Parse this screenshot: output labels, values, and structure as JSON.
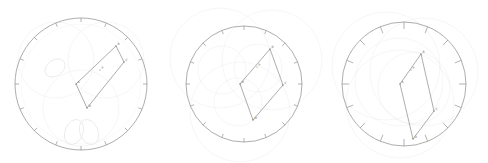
{
  "figure": {
    "title": "",
    "background_color": "#ffffff",
    "width": 488,
    "height": 163,
    "panel_count": 3
  },
  "colors": {
    "main_circle": "#8a8a8a",
    "polygon": "#8a8a8a",
    "construction_faint": "#e2e2ea",
    "construction_faint_2": "#e8e8ee",
    "tick": "#8a8a8a",
    "label": "#6a6a6a",
    "vertex_dot": "#7a7a7a",
    "background": "#ffffff"
  },
  "chart_data": {
    "type": "scatter",
    "title": "",
    "xlabel": "",
    "ylabel": "",
    "grid": false,
    "legend": "none",
    "panels": [
      {
        "name": "panel-1",
        "index": 1,
        "center": [
          81,
          84
        ],
        "main_circle_radius": 66,
        "tick_count": 16,
        "tick_length": 4,
        "tick_inward": true,
        "polygon_label": "parallelogram",
        "polygon_vertices": [
          {
            "label": "A",
            "x": 76,
            "y": 84
          },
          {
            "label": "B",
            "x": 116,
            "y": 46
          },
          {
            "label": "C",
            "x": 124,
            "y": 62
          },
          {
            "label": "D",
            "x": 87,
            "y": 108
          }
        ],
        "interior_point": {
          "label": "P",
          "x": 100,
          "y": 70
        },
        "construction_circles": [
          {
            "cx": 56,
            "cy": 60,
            "r": 38,
            "opacity": 0.42
          },
          {
            "cx": 106,
            "cy": 60,
            "r": 38,
            "opacity": 0.42
          },
          {
            "cx": 81,
            "cy": 108,
            "r": 38,
            "opacity": 0.42
          },
          {
            "cx": 81,
            "cy": 84,
            "r": 60,
            "opacity": 0.3
          }
        ],
        "curve_loops": [
          {
            "cx": 55,
            "cy": 68,
            "rx": 11,
            "ry": 8,
            "rot": -35
          },
          {
            "cx": 74,
            "cy": 132,
            "rx": 9,
            "ry": 13,
            "rot": 22
          },
          {
            "cx": 89,
            "cy": 132,
            "rx": 9,
            "ry": 13,
            "rot": -22
          }
        ]
      },
      {
        "name": "panel-2",
        "index": 2,
        "center": [
          244,
          84
        ],
        "main_circle_radius": 58,
        "tick_count": 16,
        "tick_length": 4,
        "tick_inward": true,
        "polygon_label": "rhombus",
        "polygon_vertices": [
          {
            "label": "O",
            "x": 240,
            "y": 84
          },
          {
            "label": "B",
            "x": 270,
            "y": 49
          },
          {
            "label": "C",
            "x": 283,
            "y": 85
          },
          {
            "label": "D",
            "x": 253,
            "y": 120
          }
        ],
        "interior_point": {
          "label": "P",
          "x": 257,
          "y": 67
        },
        "construction_circles": [
          {
            "cx": 220,
            "cy": 58,
            "r": 50,
            "opacity": 0.42
          },
          {
            "cx": 272,
            "cy": 60,
            "r": 50,
            "opacity": 0.42
          },
          {
            "cx": 240,
            "cy": 112,
            "r": 50,
            "opacity": 0.42
          },
          {
            "cx": 222,
            "cy": 70,
            "r": 24,
            "opacity": 0.42
          },
          {
            "cx": 258,
            "cy": 68,
            "r": 24,
            "opacity": 0.42
          },
          {
            "cx": 238,
            "cy": 102,
            "r": 24,
            "opacity": 0.42
          }
        ],
        "curve_loops": []
      },
      {
        "name": "panel-3",
        "index": 3,
        "center": [
          404,
          84
        ],
        "main_circle_radius": 62,
        "tick_count": 16,
        "tick_length": 7,
        "tick_inward": true,
        "polygon_label": "parallelogram",
        "polygon_vertices": [
          {
            "label": "A",
            "x": 400,
            "y": 84
          },
          {
            "label": "B",
            "x": 421,
            "y": 54
          },
          {
            "label": "C",
            "x": 434,
            "y": 111
          },
          {
            "label": "D",
            "x": 413,
            "y": 139
          }
        ],
        "interior_point": {
          "label": "P",
          "x": 411,
          "y": 70
        },
        "construction_circles": [
          {
            "cx": 386,
            "cy": 66,
            "r": 54,
            "opacity": 0.42
          },
          {
            "cx": 424,
            "cy": 72,
            "r": 54,
            "opacity": 0.42
          },
          {
            "cx": 400,
            "cy": 104,
            "r": 54,
            "opacity": 0.42
          },
          {
            "cx": 399,
            "cy": 82,
            "r": 44,
            "opacity": 0.42
          },
          {
            "cx": 414,
            "cy": 88,
            "r": 36,
            "opacity": 0.42
          }
        ],
        "curve_loops": []
      }
    ]
  }
}
